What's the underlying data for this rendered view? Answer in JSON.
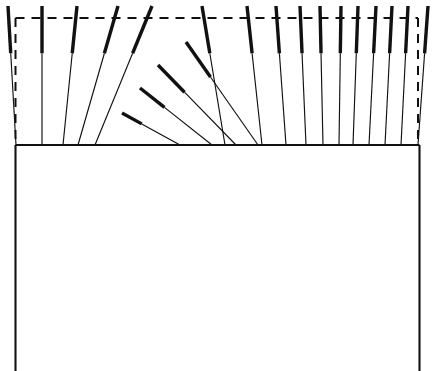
{
  "figure": {
    "canvas": {
      "width": 434,
      "height": 371
    },
    "colors": {
      "ink": "#111111",
      "background": "#ffffff"
    },
    "strokes": {
      "body_outline_width": 2.1,
      "element_thin_width": 1.15,
      "element_thick_width": 3.4,
      "dashed_width": 2.0,
      "dash_pattern": "9 7"
    },
    "body": {
      "name": "main-body-rectangle",
      "left_x": 15.5,
      "right_x": 419.5,
      "top_y": 145.0,
      "bottom_y": 371.0,
      "bottom_open": true
    },
    "reference_frame": {
      "name": "dashed-reference-rectangle",
      "left_x": 15.5,
      "right_x": 418.0,
      "top_y": 18.0,
      "bottom_y": 145.0,
      "style": "dashed"
    },
    "elements": {
      "count": 25,
      "description": "Tapered elements rising from the body top edge; each has a bold distal tip that thins toward its root.",
      "tip_fraction": 0.34,
      "outer_left": [
        {
          "root_x": 16.0,
          "tip_x": 8.0,
          "tip_y": 6.0
        },
        {
          "root_x": 42.0,
          "tip_x": 42.0,
          "tip_y": 6.0
        },
        {
          "root_x": 63.0,
          "tip_x": 77.0,
          "tip_y": 6.0
        },
        {
          "root_x": 78.0,
          "tip_x": 118.0,
          "tip_y": 6.0
        },
        {
          "root_x": 95.0,
          "tip_x": 152.0,
          "tip_y": 6.0
        }
      ],
      "inner_left": [
        {
          "root_x": 180.0,
          "tip_x": 122.0,
          "tip_y": 113.0
        },
        {
          "root_x": 212.0,
          "tip_x": 140.0,
          "tip_y": 88.0
        },
        {
          "root_x": 236.0,
          "tip_x": 158.0,
          "tip_y": 65.0
        },
        {
          "root_x": 258.0,
          "tip_x": 186.0,
          "tip_y": 42.0
        }
      ],
      "right_fan": [
        {
          "root_x": 225.0,
          "tip_x": 202.0,
          "tip_y": 6.0
        },
        {
          "root_x": 262.0,
          "tip_x": 247.0,
          "tip_y": 6.0
        },
        {
          "root_x": 286.0,
          "tip_x": 276.0,
          "tip_y": 6.0
        },
        {
          "root_x": 306.0,
          "tip_x": 300.0,
          "tip_y": 6.0
        },
        {
          "root_x": 323.0,
          "tip_x": 320.0,
          "tip_y": 6.0
        },
        {
          "root_x": 339.0,
          "tip_x": 341.0,
          "tip_y": 6.0
        },
        {
          "root_x": 353.0,
          "tip_x": 358.0,
          "tip_y": 6.0
        },
        {
          "root_x": 369.0,
          "tip_x": 376.0,
          "tip_y": 6.0
        },
        {
          "root_x": 385.0,
          "tip_x": 392.0,
          "tip_y": 6.0
        },
        {
          "root_x": 401.0,
          "tip_x": 408.0,
          "tip_y": 6.0
        },
        {
          "root_x": 418.0,
          "tip_x": 428.0,
          "tip_y": 6.0
        }
      ]
    }
  }
}
